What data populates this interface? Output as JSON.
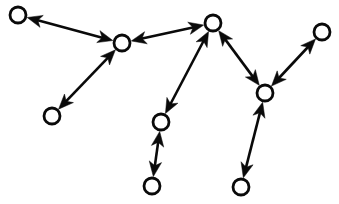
{
  "figure": {
    "width": 339,
    "height": 204,
    "background_color": "#ffffff",
    "stroke_color": "#0a0a0a",
    "node_fill_color": "#ffffff",
    "node_radius": 8,
    "edge_style": "double-headed-arrow"
  },
  "chart_data": {
    "type": "diagram",
    "title": "",
    "graph_kind": "node-link diagram",
    "directed": true,
    "node_count": 9,
    "edge_count": 8,
    "nodes": [
      {
        "id": "n1",
        "label": "",
        "x": 18,
        "y": 15,
        "r": 8
      },
      {
        "id": "n2",
        "label": "",
        "x": 122,
        "y": 43,
        "r": 8
      },
      {
        "id": "n3",
        "label": "",
        "x": 52,
        "y": 116,
        "r": 8
      },
      {
        "id": "n4",
        "label": "",
        "x": 213,
        "y": 23,
        "r": 8
      },
      {
        "id": "n5",
        "label": "",
        "x": 161,
        "y": 122,
        "r": 8
      },
      {
        "id": "n6",
        "label": "",
        "x": 152,
        "y": 186,
        "r": 8
      },
      {
        "id": "n7",
        "label": "",
        "x": 265,
        "y": 93,
        "r": 8
      },
      {
        "id": "n8",
        "label": "",
        "x": 322,
        "y": 32,
        "r": 8
      },
      {
        "id": "n9",
        "label": "",
        "x": 241,
        "y": 187,
        "r": 8
      }
    ],
    "edges": [
      {
        "source": "n2",
        "target": "n1",
        "bidirectional": true
      },
      {
        "source": "n2",
        "target": "n3",
        "bidirectional": true
      },
      {
        "source": "n2",
        "target": "n4",
        "bidirectional": true
      },
      {
        "source": "n4",
        "target": "n5",
        "bidirectional": true
      },
      {
        "source": "n5",
        "target": "n6",
        "bidirectional": true
      },
      {
        "source": "n4",
        "target": "n7",
        "bidirectional": true
      },
      {
        "source": "n7",
        "target": "n8",
        "bidirectional": true
      },
      {
        "source": "n7",
        "target": "n9",
        "bidirectional": true
      }
    ]
  }
}
